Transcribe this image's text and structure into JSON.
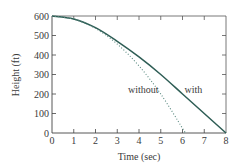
{
  "chart_data": {
    "type": "line",
    "title": "",
    "xlabel": "Time (sec)",
    "ylabel": "Height (ft)",
    "xlim": [
      0,
      8
    ],
    "ylim": [
      0,
      600
    ],
    "x_ticks": [
      "0",
      "1",
      "2",
      "3",
      "4",
      "5",
      "6",
      "7",
      "8"
    ],
    "y_ticks": [
      "0",
      "100",
      "200",
      "300",
      "400",
      "500",
      "600"
    ],
    "grid": false,
    "legend": "inline labels",
    "series": [
      {
        "name": "with",
        "style": "solid",
        "color": "#2e5d55",
        "x": [
          0,
          1,
          2,
          3,
          4,
          5,
          6,
          7,
          8
        ],
        "y": [
          600,
          585,
          540,
          470,
          390,
          300,
          200,
          100,
          0
        ]
      },
      {
        "name": "without",
        "style": "dotted",
        "color": "#5a8a80",
        "x": [
          0,
          1,
          2,
          3,
          4,
          5,
          6,
          6.12
        ],
        "y": [
          600,
          584,
          536,
          456,
          344,
          200,
          24,
          0
        ]
      }
    ],
    "annotations": [
      {
        "text": "without",
        "x": 4.2,
        "y": 205
      },
      {
        "text": "with",
        "x": 6.5,
        "y": 205
      }
    ]
  }
}
